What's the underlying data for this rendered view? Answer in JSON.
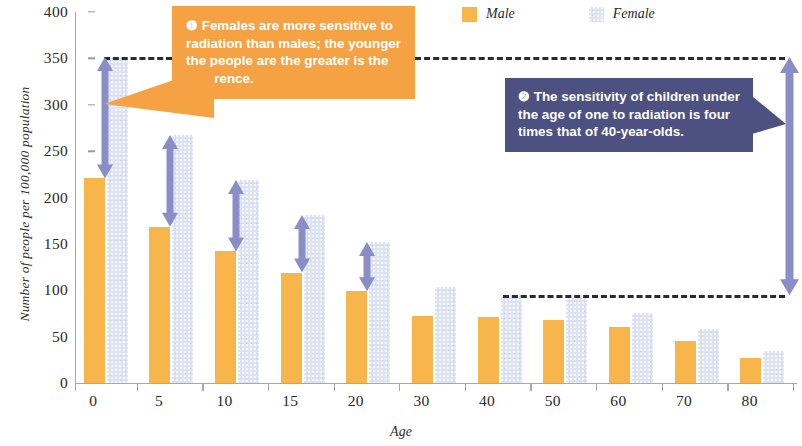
{
  "chart_data": {
    "type": "bar",
    "title": "",
    "xlabel": "Age",
    "ylabel": "Number of people per 100,000 population",
    "categories": [
      "0",
      "5",
      "10",
      "15",
      "20",
      "30",
      "40",
      "50",
      "60",
      "70",
      "80"
    ],
    "series": [
      {
        "name": "Male",
        "color": "#f8b54c",
        "values": [
          221,
          168,
          142,
          119,
          99,
          72,
          71,
          68,
          60,
          45,
          27
        ]
      },
      {
        "name": "Female",
        "color": "#dde3f2",
        "values": [
          352,
          267,
          219,
          181,
          152,
          104,
          95,
          92,
          76,
          58,
          35
        ]
      }
    ],
    "ylim": [
      0,
      400
    ],
    "yticks": [
      0,
      50,
      100,
      150,
      200,
      250,
      300,
      350,
      400
    ],
    "ytick_labels": [
      "0",
      "50",
      "100",
      "150",
      "200",
      "250",
      "300",
      "350",
      "400"
    ],
    "grid": false,
    "legend_position": "top-right",
    "annotations": [
      {
        "id": "callout-1",
        "number": "❶",
        "text": "Females are more sensitive to radiation than males; the younger the people are the greater is the difference.",
        "color": "#f5a244"
      },
      {
        "id": "callout-2",
        "number": "❷",
        "text": "The sensitivity of children under the age of one to radiation is four times that of 40-year-olds.",
        "color": "#4d5182"
      }
    ],
    "reference_lines": [
      {
        "name": "upper-dashed-line",
        "value": 352
      },
      {
        "name": "lower-dashed-line",
        "value": 95
      }
    ],
    "difference_arrows": [
      {
        "category": "0",
        "from": 221,
        "to": 352
      },
      {
        "category": "5",
        "from": 168,
        "to": 267
      },
      {
        "category": "10",
        "from": 142,
        "to": 219
      },
      {
        "category": "15",
        "from": 119,
        "to": 181
      },
      {
        "category": "20",
        "from": 99,
        "to": 152
      },
      {
        "category": "ratio-bracket",
        "from": 95,
        "to": 352
      }
    ]
  },
  "legend": {
    "items": [
      {
        "label": "Male",
        "swatch": "male-color-swatch"
      },
      {
        "label": "Female",
        "swatch": "female-color-swatch"
      }
    ]
  },
  "axes": {
    "y_title": "Number of people per 100,000 population",
    "x_title": "Age"
  },
  "callouts": {
    "one": {
      "marker": "❶",
      "text": "Females are more sensitive to radiation than males; the younger the people are the greater is the difference."
    },
    "two": {
      "marker": "❷",
      "text": "The sensitivity of children under the age of one to radiation is four times that of 40-year-olds."
    }
  }
}
